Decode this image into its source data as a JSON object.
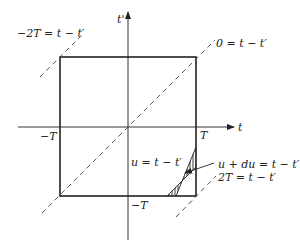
{
  "diagram": {
    "axes": {
      "horizontal_label": "t",
      "vertical_label": "t'"
    },
    "tick_labels": {
      "neg_T_horizontal": "−T",
      "pos_T_horizontal": "T",
      "neg_T_vertical": "−T"
    },
    "line_labels": {
      "minus_2T": "−2T = t − t′",
      "zero": "0 = t − t′",
      "u": "u = t − t′",
      "u_plus_du": "u + du = t − t′",
      "plus_2T": "2T = t − t′"
    },
    "colors": {
      "ink": "#222222",
      "dashed": "#555555",
      "background": "#ffffff"
    }
  }
}
